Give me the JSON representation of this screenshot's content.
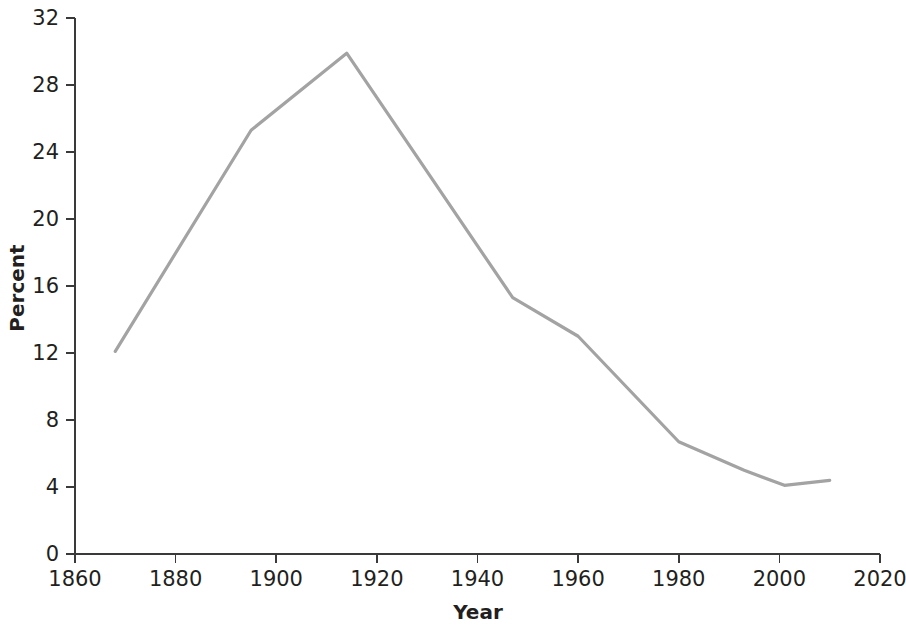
{
  "chart_data": {
    "type": "line",
    "title": "",
    "subtitle": "",
    "xlabel": "Year",
    "ylabel": "Percent",
    "xlim": [
      1860,
      2020
    ],
    "ylim": [
      0,
      32
    ],
    "xticks": [
      1860,
      1880,
      1900,
      1920,
      1940,
      1960,
      1980,
      2000,
      2020
    ],
    "yticks": [
      0,
      4,
      8,
      12,
      16,
      20,
      24,
      28,
      32
    ],
    "xtick_labels": [
      "1860",
      "1880",
      "1900",
      "1920",
      "1940",
      "1960",
      "1980",
      "2000",
      "2020"
    ],
    "ytick_labels": [
      "0",
      "4",
      "8",
      "12",
      "16",
      "20",
      "24",
      "28",
      "32"
    ],
    "grid": false,
    "legend": false,
    "legend_position": "none",
    "annotations": [],
    "series": [
      {
        "name": "Percent",
        "color": "#a3a3a3",
        "marker": "none",
        "x": [
          1868,
          1895,
          1914,
          1947,
          1960,
          1980,
          1993,
          2001,
          2010
        ],
        "values": [
          12.1,
          25.3,
          29.9,
          15.3,
          13.0,
          6.7,
          5.0,
          4.1,
          4.4
        ]
      }
    ]
  },
  "axes": {
    "x_title": "Year",
    "y_title": "Percent"
  },
  "colors": {
    "line": "#a3a3a3",
    "axis": "#3a3a3a",
    "text": "#231f20",
    "background": "#ffffff"
  }
}
